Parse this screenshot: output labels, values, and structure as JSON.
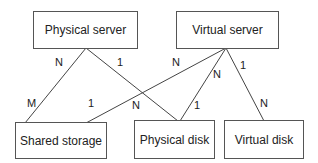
{
  "diagram": {
    "type": "entity-relationship",
    "entities": [
      {
        "id": "physical_server",
        "label": "Physical server"
      },
      {
        "id": "virtual_server",
        "label": "Virtual server"
      },
      {
        "id": "shared_storage",
        "label": "Shared storage"
      },
      {
        "id": "physical_disk",
        "label": "Physical disk"
      },
      {
        "id": "virtual_disk",
        "label": "Virtual disk"
      }
    ],
    "relationships": [
      {
        "from": "physical_server",
        "to": "shared_storage",
        "from_card": "N",
        "to_card": "M"
      },
      {
        "from": "physical_server",
        "to": "physical_disk",
        "from_card": "1",
        "to_card": "N"
      },
      {
        "from": "virtual_server",
        "to": "shared_storage",
        "from_card": "N",
        "to_card": "1"
      },
      {
        "from": "virtual_server",
        "to": "physical_disk",
        "from_card": "N",
        "to_card": "1"
      },
      {
        "from": "virtual_server",
        "to": "virtual_disk",
        "from_card": "1",
        "to_card": "N"
      }
    ],
    "line_color": "#444444"
  }
}
